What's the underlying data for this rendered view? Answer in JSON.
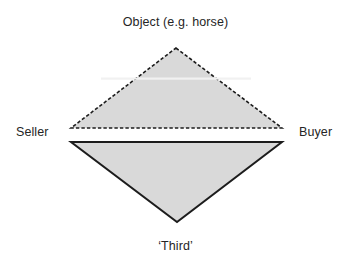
{
  "figure": {
    "type": "triangle-pair-diagram",
    "background_color": "#ffffff",
    "labels": {
      "top": "Object (e.g. horse)",
      "left": "Seller",
      "right": "Buyer",
      "bottom": "‘Third’"
    },
    "shapes": {
      "upper_triangle": {
        "name": "upper-triangle",
        "fill_color": "#d9d9d9",
        "stroke_color": "#1c1c1c",
        "stroke_style": "dashed",
        "stroke_width": 1.6,
        "points": "176,48 282,128 71,128"
      },
      "lower_triangle": {
        "name": "lower-triangle",
        "fill_color": "#d9d9d9",
        "stroke_color": "#1c1c1c",
        "stroke_style": "solid",
        "stroke_width": 2,
        "points": "71,142 282,142 177,222"
      }
    }
  }
}
